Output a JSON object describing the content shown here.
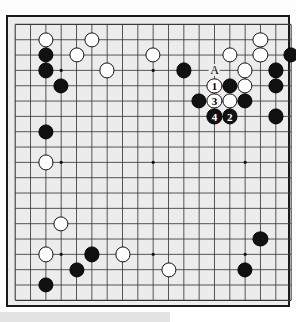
{
  "diagram": {
    "type": "go-board",
    "board_size": 19,
    "board_background_color": "#ececec",
    "border_color": "#1a1a1a",
    "line_color": "#3a3a3a",
    "black_stone_color": "#111111",
    "white_stone_color": "#ffffff",
    "star_points": [
      {
        "col": 3,
        "row": 3
      },
      {
        "col": 9,
        "row": 3
      },
      {
        "col": 15,
        "row": 3
      },
      {
        "col": 3,
        "row": 9
      },
      {
        "col": 9,
        "row": 9
      },
      {
        "col": 15,
        "row": 9
      },
      {
        "col": 3,
        "row": 15
      },
      {
        "col": 9,
        "row": 15
      },
      {
        "col": 15,
        "row": 15
      }
    ],
    "stones": [
      {
        "col": 2,
        "row": 1,
        "color": "white"
      },
      {
        "col": 5,
        "row": 1,
        "color": "white"
      },
      {
        "col": 16,
        "row": 1,
        "color": "white"
      },
      {
        "col": 2,
        "row": 2,
        "color": "black"
      },
      {
        "col": 4,
        "row": 2,
        "color": "white"
      },
      {
        "col": 9,
        "row": 2,
        "color": "white"
      },
      {
        "col": 14,
        "row": 2,
        "color": "white"
      },
      {
        "col": 16,
        "row": 2,
        "color": "white"
      },
      {
        "col": 18,
        "row": 2,
        "color": "black"
      },
      {
        "col": 2,
        "row": 3,
        "color": "black"
      },
      {
        "col": 6,
        "row": 3,
        "color": "white"
      },
      {
        "col": 11,
        "row": 3,
        "color": "black"
      },
      {
        "col": 15,
        "row": 3,
        "color": "white"
      },
      {
        "col": 17,
        "row": 3,
        "color": "black"
      },
      {
        "col": 3,
        "row": 4,
        "color": "black"
      },
      {
        "col": 14,
        "row": 4,
        "color": "black"
      },
      {
        "col": 15,
        "row": 4,
        "color": "white"
      },
      {
        "col": 17,
        "row": 4,
        "color": "black"
      },
      {
        "col": 12,
        "row": 5,
        "color": "black"
      },
      {
        "col": 14,
        "row": 5,
        "color": "white"
      },
      {
        "col": 15,
        "row": 5,
        "color": "black"
      },
      {
        "col": 17,
        "row": 6,
        "color": "black"
      },
      {
        "col": 2,
        "row": 7,
        "color": "black"
      },
      {
        "col": 2,
        "row": 9,
        "color": "white"
      },
      {
        "col": 3,
        "row": 13,
        "color": "white"
      },
      {
        "col": 2,
        "row": 15,
        "color": "white"
      },
      {
        "col": 5,
        "row": 15,
        "color": "black"
      },
      {
        "col": 7,
        "row": 15,
        "color": "white"
      },
      {
        "col": 16,
        "row": 14,
        "color": "black"
      },
      {
        "col": 4,
        "row": 16,
        "color": "black"
      },
      {
        "col": 10,
        "row": 16,
        "color": "white"
      },
      {
        "col": 15,
        "row": 16,
        "color": "black"
      },
      {
        "col": 2,
        "row": 17,
        "color": "black"
      }
    ],
    "move_stones": [
      {
        "label": "1",
        "col": 13,
        "row": 4,
        "color": "white"
      },
      {
        "label": "2",
        "col": 14,
        "row": 6,
        "color": "black"
      },
      {
        "label": "3",
        "col": 13,
        "row": 5,
        "color": "white"
      },
      {
        "label": "4",
        "col": 13,
        "row": 6,
        "color": "black"
      }
    ],
    "point_labels": [
      {
        "label": "A",
        "col": 13,
        "row": 3
      }
    ]
  }
}
